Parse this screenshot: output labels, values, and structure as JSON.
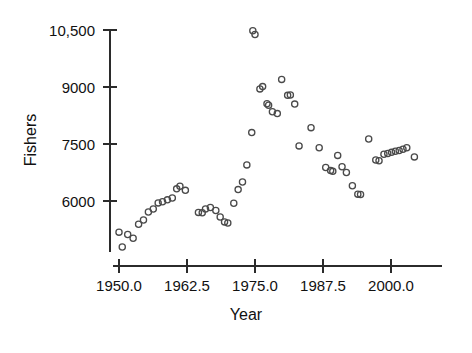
{
  "chart_data": {
    "type": "scatter",
    "title": "",
    "xlabel": "Year",
    "ylabel": "Fishers",
    "xlim": [
      1949.0,
      2006.5
    ],
    "ylim": [
      4650,
      10850
    ],
    "grid": false,
    "legend": null,
    "xticks": [
      1950.0,
      1962.5,
      1975.0,
      1987.5,
      2000.0
    ],
    "xticklabels": [
      "1950.0",
      "1962.5",
      "1975.0",
      "1987.5",
      "2000.0"
    ],
    "yticks": [
      6000,
      7500,
      9000,
      10500
    ],
    "yticklabels": [
      "6000",
      "7500",
      "9000",
      "10,500"
    ],
    "marker": "open-circle",
    "marker_color": "#4a4a4a",
    "points": [
      {
        "x": 1950.0,
        "y": 5180
      },
      {
        "x": 1950.6,
        "y": 4790
      },
      {
        "x": 1951.6,
        "y": 5120
      },
      {
        "x": 1952.6,
        "y": 5020
      },
      {
        "x": 1953.6,
        "y": 5390
      },
      {
        "x": 1954.5,
        "y": 5500
      },
      {
        "x": 1955.4,
        "y": 5710
      },
      {
        "x": 1956.3,
        "y": 5790
      },
      {
        "x": 1957.2,
        "y": 5950
      },
      {
        "x": 1958.0,
        "y": 5980
      },
      {
        "x": 1958.9,
        "y": 6030
      },
      {
        "x": 1959.8,
        "y": 6080
      },
      {
        "x": 1960.6,
        "y": 6320
      },
      {
        "x": 1961.2,
        "y": 6390
      },
      {
        "x": 1962.2,
        "y": 6280
      },
      {
        "x": 1964.6,
        "y": 5700
      },
      {
        "x": 1965.3,
        "y": 5690
      },
      {
        "x": 1965.9,
        "y": 5790
      },
      {
        "x": 1966.8,
        "y": 5830
      },
      {
        "x": 1967.8,
        "y": 5750
      },
      {
        "x": 1968.6,
        "y": 5580
      },
      {
        "x": 1969.4,
        "y": 5450
      },
      {
        "x": 1970.0,
        "y": 5420
      },
      {
        "x": 1971.1,
        "y": 5940
      },
      {
        "x": 1971.9,
        "y": 6300
      },
      {
        "x": 1972.7,
        "y": 6500
      },
      {
        "x": 1973.5,
        "y": 6950
      },
      {
        "x": 1974.4,
        "y": 7800
      },
      {
        "x": 1974.6,
        "y": 10480
      },
      {
        "x": 1975.0,
        "y": 10380
      },
      {
        "x": 1975.9,
        "y": 8950
      },
      {
        "x": 1976.4,
        "y": 9010
      },
      {
        "x": 1977.2,
        "y": 8560
      },
      {
        "x": 1977.5,
        "y": 8520
      },
      {
        "x": 1978.2,
        "y": 8350
      },
      {
        "x": 1979.1,
        "y": 8300
      },
      {
        "x": 1979.9,
        "y": 9200
      },
      {
        "x": 1981.0,
        "y": 8780
      },
      {
        "x": 1981.5,
        "y": 8790
      },
      {
        "x": 1982.3,
        "y": 8550
      },
      {
        "x": 1983.1,
        "y": 7450
      },
      {
        "x": 1985.3,
        "y": 7930
      },
      {
        "x": 1986.8,
        "y": 7400
      },
      {
        "x": 1988.0,
        "y": 6880
      },
      {
        "x": 1988.9,
        "y": 6800
      },
      {
        "x": 1989.3,
        "y": 6780
      },
      {
        "x": 1990.2,
        "y": 7200
      },
      {
        "x": 1991.0,
        "y": 6900
      },
      {
        "x": 1991.8,
        "y": 6750
      },
      {
        "x": 1992.9,
        "y": 6400
      },
      {
        "x": 1993.9,
        "y": 6180
      },
      {
        "x": 1994.4,
        "y": 6170
      },
      {
        "x": 1995.9,
        "y": 7630
      },
      {
        "x": 1997.2,
        "y": 7080
      },
      {
        "x": 1997.8,
        "y": 7060
      },
      {
        "x": 1998.7,
        "y": 7230
      },
      {
        "x": 1999.4,
        "y": 7250
      },
      {
        "x": 2000.1,
        "y": 7280
      },
      {
        "x": 2000.8,
        "y": 7310
      },
      {
        "x": 2001.5,
        "y": 7330
      },
      {
        "x": 2002.2,
        "y": 7360
      },
      {
        "x": 2002.9,
        "y": 7400
      },
      {
        "x": 2004.3,
        "y": 7160
      }
    ]
  }
}
